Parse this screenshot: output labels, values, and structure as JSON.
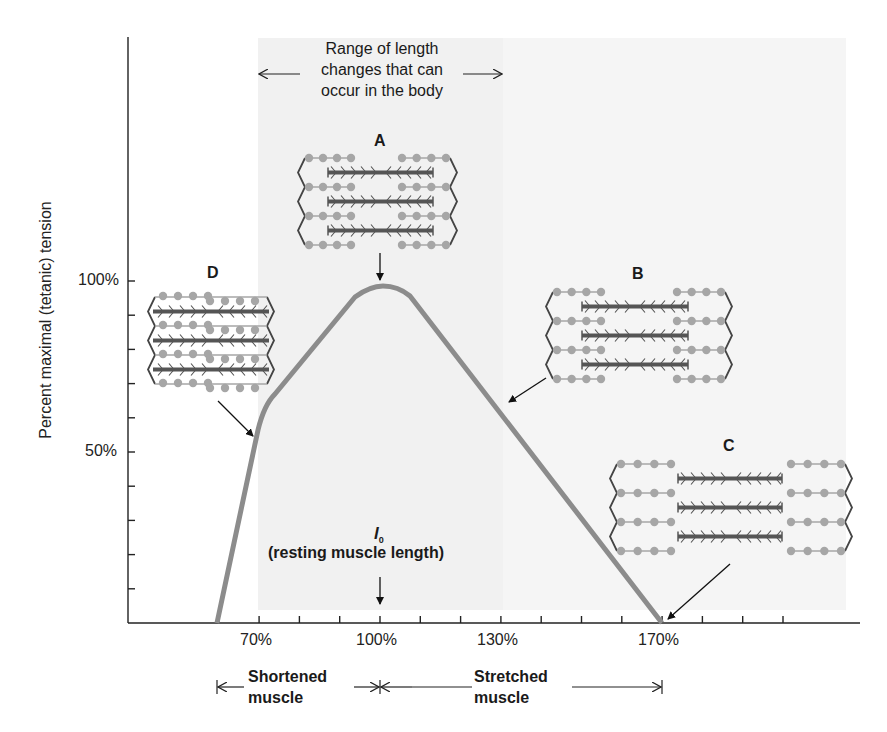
{
  "chart_data": {
    "type": "line",
    "xlabel": "Muscle length (% of resting length l0)",
    "ylabel": "Percent maximal (tetanic) tension",
    "x_tick_labels": [
      "70%",
      "100%",
      "130%",
      "170%"
    ],
    "y_tick_labels": [
      "100%",
      "50%"
    ],
    "x_ticks_minor_step": 10,
    "y_ticks_minor_step": 10,
    "xlim": [
      50,
      170
    ],
    "ylim": [
      0,
      100
    ],
    "grid": false,
    "series": [
      {
        "name": "Tension",
        "color": "#8c8c8c",
        "x": [
          60,
          72,
          80,
          90,
          95,
          100,
          105,
          110,
          120,
          130,
          140,
          150,
          160,
          170
        ],
        "y": [
          0,
          64,
          78,
          92,
          97,
          98,
          97,
          94,
          80,
          66,
          52,
          38,
          24,
          0
        ]
      }
    ],
    "annotations": [
      {
        "label": "A",
        "x": 100,
        "y": 98,
        "description": "Optimal overlap at resting length"
      },
      {
        "label": "B",
        "x": 137,
        "y": 66,
        "description": "Stretched: reduced overlap"
      },
      {
        "label": "C",
        "x": 170,
        "y": 0,
        "description": "Overstretched: no overlap"
      },
      {
        "label": "D",
        "x": 70,
        "y": 56,
        "description": "Shortened: filaments overlap excessively"
      }
    ],
    "shaded_region": {
      "description": "Range of length changes that can occur in the body",
      "x_from": 70,
      "x_to": 130
    }
  },
  "labels": {
    "y_axis_title": "Percent maximal (tetanic) tension",
    "y_100": "100%",
    "y_50": "50%",
    "x_70": "70%",
    "x_100": "100%",
    "x_130": "130%",
    "x_170": "170%",
    "range_line1": "Range of length",
    "range_line2": "changes that can",
    "range_line3": "occur in the body",
    "letter_a": "A",
    "letter_b": "B",
    "letter_c": "C",
    "letter_d": "D",
    "l0_symbol": "l",
    "l0_sub": "0",
    "resting": "(resting muscle length)",
    "shortened_1": "Shortened",
    "shortened_2": "muscle",
    "stretched_1": "Stretched",
    "stretched_2": "muscle"
  },
  "colors": {
    "curve": "#8c8c8c",
    "actin_dots": "#a6a6a6",
    "myosin": "#555555",
    "shade": "#f3f3f3",
    "axis": "#222222"
  }
}
